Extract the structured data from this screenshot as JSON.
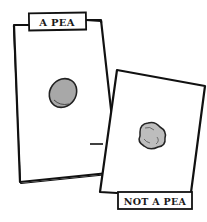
{
  "cards": [
    {
      "label": "A PEA",
      "object": "pea"
    },
    {
      "label": "NOT A PEA",
      "object": "pea-like-object"
    }
  ],
  "colors": {
    "outline": "#111111",
    "pea_fill": "#a8a8a8",
    "not_pea_fill": "#bdbdbd",
    "background": "#ffffff"
  }
}
